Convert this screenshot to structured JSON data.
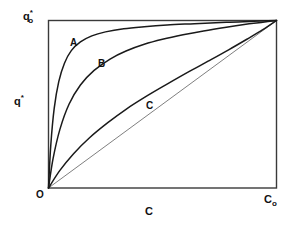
{
  "figure": {
    "background_color": "#ffffff",
    "line_color": "#1a1a1a",
    "frame_color": "#333333"
  },
  "axes": {
    "y_axis_title": "q",
    "y_axis_title_sup": "*",
    "y_max_label_base": "q",
    "y_max_label_sub": "o",
    "y_max_label_sup": "*",
    "x_axis_title": "C",
    "x_max_label_base": "C",
    "x_max_label_sub": "o",
    "origin_label": "O"
  },
  "curves": [
    {
      "id": "A",
      "label": "A"
    },
    {
      "id": "B",
      "label": "B"
    },
    {
      "id": "D",
      "label": ""
    },
    {
      "id": "C",
      "label": "C"
    }
  ],
  "chart_data": {
    "type": "line",
    "title": "",
    "subtitle": "",
    "xlabel": "C",
    "ylabel": "q*",
    "xlim": [
      0,
      1
    ],
    "ylim": [
      0,
      1
    ],
    "grid": false,
    "legend": "inline-curve-labels",
    "x_tick_labels": [
      "O",
      "Co"
    ],
    "y_tick_labels": [
      "",
      "qo*"
    ],
    "annotations": [
      {
        "text": "A",
        "x": 0.1,
        "y": 0.885
      },
      {
        "text": "B",
        "x": 0.225,
        "y": 0.76
      },
      {
        "text": "C",
        "x": 0.435,
        "y": 0.505
      }
    ],
    "series": [
      {
        "name": "A",
        "description": "strongly favourable isotherm",
        "x": [
          0,
          0.01,
          0.025,
          0.045,
          0.07,
          0.1,
          0.14,
          0.19,
          0.25,
          0.33,
          0.42,
          0.52,
          0.64,
          0.78,
          0.9,
          1.0
        ],
        "y": [
          0,
          0.255,
          0.475,
          0.635,
          0.745,
          0.82,
          0.872,
          0.908,
          0.932,
          0.951,
          0.963,
          0.973,
          0.981,
          0.99,
          0.995,
          1.0
        ]
      },
      {
        "name": "B",
        "description": "favourable isotherm",
        "x": [
          0,
          0.02,
          0.05,
          0.09,
          0.14,
          0.2,
          0.27,
          0.34,
          0.42,
          0.5,
          0.59,
          0.68,
          0.78,
          0.88,
          0.94,
          1.0
        ],
        "y": [
          0,
          0.175,
          0.35,
          0.5,
          0.615,
          0.702,
          0.77,
          0.818,
          0.858,
          0.888,
          0.915,
          0.938,
          0.96,
          0.98,
          0.99,
          1.0
        ]
      },
      {
        "name": "D",
        "description": "linear isotherm (straight chord)",
        "x": [
          0,
          1.0
        ],
        "y": [
          0,
          1.0
        ]
      },
      {
        "name": "C",
        "description": "weakly favourable isotherm",
        "x": [
          0,
          0.05,
          0.11,
          0.18,
          0.26,
          0.34,
          0.43,
          0.52,
          0.61,
          0.7,
          0.79,
          0.87,
          0.94,
          1.0
        ],
        "y": [
          0,
          0.105,
          0.205,
          0.3,
          0.39,
          0.47,
          0.548,
          0.62,
          0.69,
          0.757,
          0.825,
          0.888,
          0.945,
          1.0
        ]
      }
    ]
  }
}
